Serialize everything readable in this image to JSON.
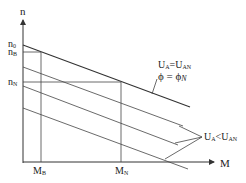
{
  "diagram": {
    "title": "",
    "axes": {
      "y_label": "n",
      "x_label": "M"
    },
    "y_ticks": [
      {
        "main": "n",
        "sub": "0"
      },
      {
        "main": "n",
        "sub": "B"
      },
      {
        "main": "n",
        "sub": "N"
      }
    ],
    "x_ticks": [
      {
        "main": "M",
        "sub": "B"
      },
      {
        "main": "M",
        "sub": "N"
      }
    ],
    "annotations": {
      "rated_voltage": {
        "left": "U",
        "left_sub": "A",
        "op": "=",
        "right": "U",
        "right_sub": "AN"
      },
      "rated_flux": {
        "left": "ϕ",
        "op": " = ",
        "right": "ϕ",
        "right_sub": "N"
      },
      "reduced_voltage": {
        "left": "U",
        "left_sub": "A",
        "op": "<",
        "right": "U",
        "right_sub": "AN"
      }
    },
    "colors": {
      "line": "#333333",
      "text": "#222222"
    }
  }
}
